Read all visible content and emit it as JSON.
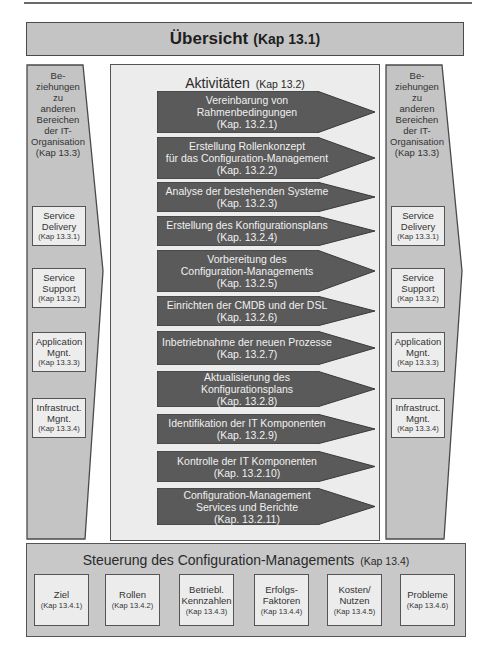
{
  "overview": {
    "title": "Übersicht",
    "kap": "(Kap 13.1)"
  },
  "relations_panel": {
    "heading_lines": [
      "Be-",
      "ziehungen",
      "zu",
      "anderen",
      "Bereichen",
      "der IT-",
      "Organisation",
      "(Kap 13.3)"
    ],
    "items": [
      {
        "lines": [
          "Service",
          "Delivery"
        ],
        "kap": "(Kap 13.3.1)"
      },
      {
        "lines": [
          "Service",
          "Support"
        ],
        "kap": "(Kap 13.3.2)"
      },
      {
        "lines": [
          "Application",
          "Mgnt."
        ],
        "kap": "(Kap 13.3.3)"
      },
      {
        "lines": [
          "Infrastruct.",
          "Mgnt."
        ],
        "kap": "(Kap 13.3.4)"
      }
    ]
  },
  "activities": {
    "title": "Aktivitäten",
    "kap": "(Kap 13.2)",
    "items": [
      {
        "lines": [
          "Vereinbarung von",
          "Rahmenbedingungen",
          "(Kap. 13.2.1)"
        ]
      },
      {
        "lines": [
          "Erstellung Rollenkonzept",
          "für  das Configuration-Management",
          "(Kap. 13.2.2)"
        ]
      },
      {
        "lines": [
          "Analyse der bestehenden Systeme",
          "(Kap. 13.2.3)"
        ]
      },
      {
        "lines": [
          "Erstellung des Konfigurationsplans",
          "(Kap. 13.2.4)"
        ]
      },
      {
        "lines": [
          "Vorbereitung des",
          "Configuration-Managements",
          "(Kap. 13.2.5)"
        ]
      },
      {
        "lines": [
          "Einrichten der CMDB und der DSL",
          "(Kap. 13.2.6)"
        ]
      },
      {
        "lines": [
          "Inbetriebnahme der neuen Prozesse",
          "(Kap. 13.2.7)"
        ]
      },
      {
        "lines": [
          "Aktualisierung des Konfigurationsplans",
          "(Kap. 13.2.8)"
        ]
      },
      {
        "lines": [
          "Identifikation der IT Komponenten",
          "(Kap. 13.2.9)"
        ]
      },
      {
        "lines": [
          "Kontrolle der IT Komponenten",
          "(Kap. 13.2.10)"
        ]
      },
      {
        "lines": [
          "Configuration-Management",
          "Services und Berichte",
          "(Kap. 13.2.11)"
        ]
      }
    ]
  },
  "steering": {
    "title": "Steuerung des Configuration-Managements",
    "kap": "(Kap 13.4)",
    "items": [
      {
        "lines": [
          "Ziel"
        ],
        "kap": "(Kap 13.4.1)"
      },
      {
        "lines": [
          "Rollen"
        ],
        "kap": "(Kap 13.4.2)"
      },
      {
        "lines": [
          "Betriebl.",
          "Kennzahlen"
        ],
        "kap": "(Kap 13.4.3)"
      },
      {
        "lines": [
          "Erfolgs-",
          "Faktoren"
        ],
        "kap": "(Kap 13.4.4)"
      },
      {
        "lines": [
          "Kosten/",
          "Nutzen"
        ],
        "kap": "(Kap 13.4.5)"
      },
      {
        "lines": [
          "Probleme"
        ],
        "kap": "(Kap 13.4.6)"
      }
    ]
  },
  "colors": {
    "panel_fill": "#c4c4c4",
    "arrow_fill": "#5a5a5a",
    "light_box": "#ececec",
    "border": "#4a4a4a"
  }
}
